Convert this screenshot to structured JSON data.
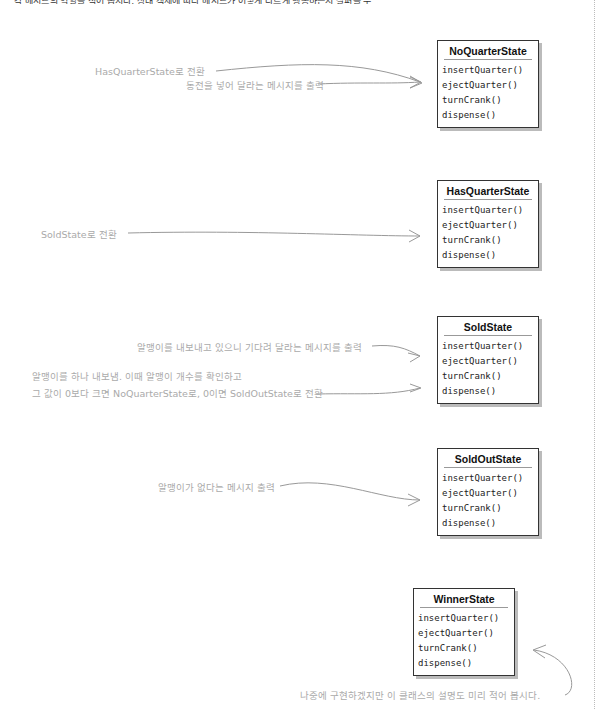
{
  "top_text": "각 메서드의 역할을 적어 봅시다. 상태 객체에 따라 메서드가 어떻게 다르게 행동하는지 살펴볼 수 있습니다.",
  "states": [
    {
      "name": "NoQuarterState",
      "methods": [
        "insertQuarter()",
        "ejectQuarter()",
        "turnCrank()",
        "dispense()"
      ]
    },
    {
      "name": "HasQuarterState",
      "methods": [
        "insertQuarter()",
        "ejectQuarter()",
        "turnCrank()",
        "dispense()"
      ]
    },
    {
      "name": "SoldState",
      "methods": [
        "insertQuarter()",
        "ejectQuarter()",
        "turnCrank()",
        "dispense()"
      ]
    },
    {
      "name": "SoldOutState",
      "methods": [
        "insertQuarter()",
        "ejectQuarter()",
        "turnCrank()",
        "dispense()"
      ]
    },
    {
      "name": "WinnerState",
      "methods": [
        "insertQuarter()",
        "ejectQuarter()",
        "turnCrank()",
        "dispense()"
      ]
    }
  ],
  "annotations": {
    "noquarter_insert": "HasQuarterState로 전환",
    "noquarter_eject": "동전을 넣어 달라는 메시지를 출력",
    "hasquarter_turn": "SoldState로 전환",
    "sold_turn": "알맹이를 내보내고 있으니 기다려 달라는 메시지를 출력",
    "sold_dispense_1": "알맹이를 하나 내보냄. 이때 알맹이 개수를 확인하고",
    "sold_dispense_2": "그 값이 0보다 크면 NoQuarterState로, 0이면 SoldOutState로 전환",
    "soldout_eject": "알맹이가 없다는 메시지 출력",
    "winner_note": "나중에 구현하겠지만 이 클래스의 설명도 미리 적어 봅시다."
  },
  "colors": {
    "note_text": "#aaaaaa",
    "arrow": "#999999",
    "box_border": "#333333",
    "shadow": "#bbbbbb"
  }
}
